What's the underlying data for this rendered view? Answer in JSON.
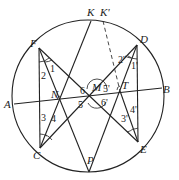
{
  "figure": {
    "type": "geometry-diagram",
    "points": {
      "K": "K",
      "K_prime": "K'",
      "F": "F",
      "D": "D",
      "A": "A",
      "B": "B",
      "N": "N",
      "M": "M",
      "T": "T",
      "C": "C",
      "E": "E",
      "P": "P"
    },
    "angles": {
      "a1": "1",
      "a2": "2",
      "a3": "3",
      "a4": "4",
      "a5": "5",
      "a6": "6",
      "a1p": "1'",
      "a2p": "2'",
      "a3p": "3'",
      "a4p": "4'",
      "a5p": "5'",
      "a6p": "6'"
    },
    "segments": [
      "AB",
      "FE",
      "DC",
      "FC",
      "DE",
      "KC",
      "FP",
      "DP",
      "K'E (dashed K'T)"
    ]
  }
}
